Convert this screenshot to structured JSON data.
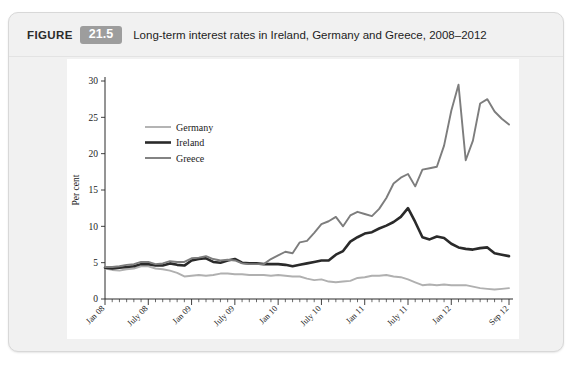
{
  "header": {
    "figure_word": "FIGURE",
    "figure_number": "21.5",
    "title": "Long-term interest rates in Ireland, Germany and Greece, 2008–2012",
    "badge_color": "#9d9d9d"
  },
  "chart_data": {
    "type": "line",
    "title": "Long-term interest rates in Ireland, Germany and Greece, 2008–2012",
    "xlabel": "Year",
    "ylabel": "Per cent",
    "ylim": [
      0,
      30
    ],
    "yticks": [
      0,
      5,
      10,
      15,
      20,
      25,
      30
    ],
    "grid": false,
    "legend_position": "upper-left-inside",
    "x_tick_labels": [
      "Jan 08",
      "July 08",
      "Jan 09",
      "July 09",
      "Jan 10",
      "July 10",
      "Jan 11",
      "July 11",
      "Jan 12",
      "Sep 12"
    ],
    "x_tick_indices": [
      0,
      6,
      12,
      18,
      24,
      30,
      36,
      42,
      48,
      56
    ],
    "x": [
      "Jan 08",
      "Feb 08",
      "Mar 08",
      "Apr 08",
      "May 08",
      "Jun 08",
      "Jul 08",
      "Aug 08",
      "Sep 08",
      "Oct 08",
      "Nov 08",
      "Dec 08",
      "Jan 09",
      "Feb 09",
      "Mar 09",
      "Apr 09",
      "May 09",
      "Jun 09",
      "Jul 09",
      "Aug 09",
      "Sep 09",
      "Oct 09",
      "Nov 09",
      "Dec 09",
      "Jan 10",
      "Feb 10",
      "Mar 10",
      "Apr 10",
      "May 10",
      "Jun 10",
      "Jul 10",
      "Aug 10",
      "Sep 10",
      "Oct 10",
      "Nov 10",
      "Dec 10",
      "Jan 11",
      "Feb 11",
      "Mar 11",
      "Apr 11",
      "May 11",
      "Jun 11",
      "Jul 11",
      "Aug 11",
      "Sep 11",
      "Oct 11",
      "Nov 11",
      "Dec 11",
      "Jan 12",
      "Feb 12",
      "Mar 12",
      "Apr 12",
      "May 12",
      "Jun 12",
      "Jul 12",
      "Aug 12",
      "Sep 12"
    ],
    "series": [
      {
        "name": "Germany",
        "color": "#b0b0b0",
        "width": 1.9,
        "values": [
          4.2,
          4.0,
          3.9,
          4.1,
          4.2,
          4.5,
          4.5,
          4.2,
          4.1,
          3.9,
          3.6,
          3.1,
          3.2,
          3.3,
          3.2,
          3.3,
          3.5,
          3.5,
          3.4,
          3.4,
          3.3,
          3.3,
          3.3,
          3.2,
          3.3,
          3.2,
          3.1,
          3.1,
          2.8,
          2.6,
          2.7,
          2.4,
          2.3,
          2.4,
          2.5,
          2.9,
          3.0,
          3.2,
          3.2,
          3.3,
          3.1,
          3.0,
          2.7,
          2.3,
          1.9,
          2.0,
          1.9,
          2.0,
          1.9,
          1.9,
          1.9,
          1.7,
          1.5,
          1.4,
          1.3,
          1.4,
          1.5
        ]
      },
      {
        "name": "Ireland",
        "color": "#2a2a2a",
        "width": 2.6,
        "values": [
          4.3,
          4.2,
          4.3,
          4.4,
          4.5,
          4.8,
          4.8,
          4.6,
          4.6,
          4.9,
          4.7,
          4.6,
          5.3,
          5.5,
          5.6,
          5.1,
          5.0,
          5.3,
          5.5,
          5.0,
          4.9,
          4.9,
          4.8,
          4.8,
          4.8,
          4.7,
          4.5,
          4.7,
          4.9,
          5.1,
          5.3,
          5.3,
          6.1,
          6.6,
          7.9,
          8.5,
          9.0,
          9.2,
          9.7,
          10.1,
          10.6,
          11.3,
          12.5,
          10.6,
          8.5,
          8.2,
          8.6,
          8.4,
          7.6,
          7.1,
          6.9,
          6.8,
          7.0,
          7.1,
          6.3,
          6.1,
          5.9
        ]
      },
      {
        "name": "Greece",
        "color": "#7d7d7d",
        "width": 1.9,
        "values": [
          4.4,
          4.4,
          4.5,
          4.7,
          4.8,
          5.1,
          5.1,
          4.8,
          4.9,
          5.2,
          5.1,
          5.1,
          5.6,
          5.7,
          5.9,
          5.5,
          5.3,
          5.4,
          5.3,
          4.9,
          4.8,
          4.8,
          4.8,
          5.5,
          6.0,
          6.5,
          6.3,
          7.8,
          8.0,
          9.1,
          10.3,
          10.7,
          11.3,
          10.0,
          11.5,
          12.0,
          11.7,
          11.4,
          12.4,
          13.9,
          15.9,
          16.7,
          17.2,
          15.5,
          17.8,
          18.0,
          18.2,
          21.1,
          25.9,
          29.5,
          19.1,
          21.8,
          26.9,
          27.5,
          25.8,
          24.8,
          24.0
        ]
      }
    ]
  },
  "legend": {
    "items": [
      {
        "label": "Germany"
      },
      {
        "label": "Ireland"
      },
      {
        "label": "Greece"
      }
    ]
  }
}
